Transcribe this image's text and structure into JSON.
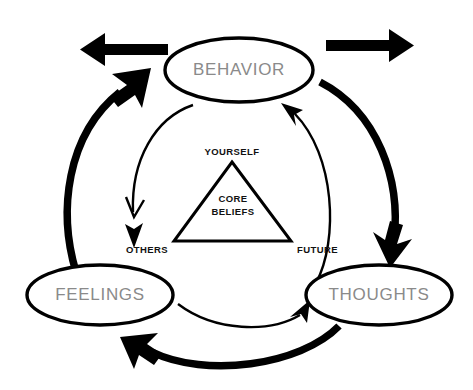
{
  "diagram": {
    "nodes": [
      {
        "id": "behavior",
        "label": "BEHAVIOR",
        "position": "top"
      },
      {
        "id": "feelings",
        "label": "FEELINGS",
        "position": "bottom-left"
      },
      {
        "id": "thoughts",
        "label": "THOUGHTS",
        "position": "bottom-right"
      }
    ],
    "center": {
      "core_line1": "CORE",
      "core_line2": "BELIEFS",
      "vertex_top": "YOURSELF",
      "vertex_bottom_left": "OTHERS",
      "vertex_bottom_right": "FUTURE"
    },
    "connections": [
      {
        "id": "feelings-to-behavior",
        "from": "FEELINGS",
        "to": "BEHAVIOR",
        "weight": "thick"
      },
      {
        "id": "behavior-to-thoughts",
        "from": "BEHAVIOR",
        "to": "THOUGHTS",
        "weight": "thick"
      },
      {
        "id": "thoughts-to-feelings",
        "from": "THOUGHTS",
        "to": "FEELINGS",
        "weight": "thick"
      },
      {
        "id": "behavior-to-feelings",
        "from": "BEHAVIOR",
        "to": "FEELINGS",
        "weight": "thin"
      },
      {
        "id": "feelings-to-thoughts",
        "from": "FEELINGS",
        "to": "THOUGHTS",
        "weight": "thin"
      },
      {
        "id": "thoughts-to-behavior",
        "from": "THOUGHTS",
        "to": "BEHAVIOR",
        "weight": "thin"
      }
    ],
    "external_arrows": [
      {
        "id": "external-arrow-left",
        "direction": "left"
      },
      {
        "id": "external-arrow-right",
        "direction": "right"
      }
    ],
    "colors": {
      "stroke": "#000000",
      "node_label": "#8a8a8a",
      "background": "#ffffff",
      "center_text": "#111111"
    }
  }
}
